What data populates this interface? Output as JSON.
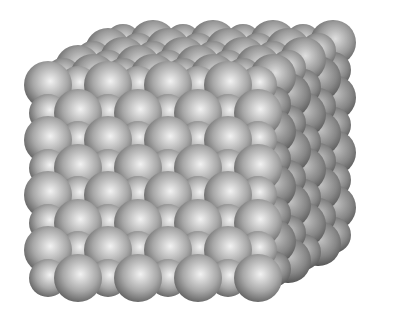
{
  "image": {
    "subject": "Crystal lattice cube of packed spheres",
    "background": "#ffffff",
    "width": 393,
    "height": 313
  },
  "lattice": {
    "colors": {
      "highlight": "#f2f2f2",
      "mid": "#a8a8a8",
      "shadow": "#555555",
      "edge": "#2e2e2e"
    },
    "front_face": {
      "origin_x": 48,
      "origin_y": 85,
      "pitch_x": 60,
      "pitch_y": 55,
      "cols": 4,
      "rows": 4,
      "big_radius": 24,
      "small_radius": 19
    },
    "depth_vector": {
      "dx": 15,
      "dy": -8.5
    },
    "depth_layers": 6
  }
}
